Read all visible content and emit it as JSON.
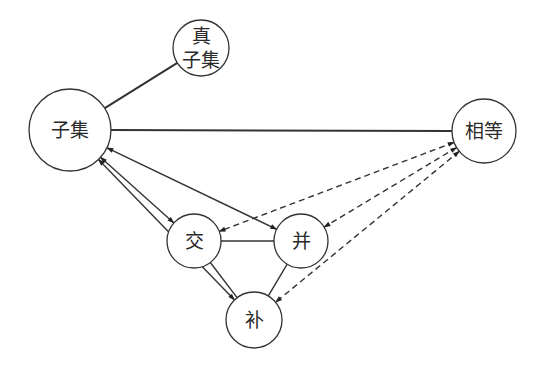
{
  "diagram": {
    "title": "",
    "nodes": [
      {
        "id": "proper_subset",
        "lines": [
          "真",
          "子集"
        ],
        "cx": 201,
        "cy": 48,
        "r": 28
      },
      {
        "id": "subset",
        "lines": [
          "子集"
        ],
        "cx": 70,
        "cy": 130,
        "r": 41
      },
      {
        "id": "equal",
        "lines": [
          "相等"
        ],
        "cx": 484,
        "cy": 131,
        "r": 32
      },
      {
        "id": "intersection",
        "lines": [
          "交"
        ],
        "cx": 194,
        "cy": 241,
        "r": 27
      },
      {
        "id": "union",
        "lines": [
          "并"
        ],
        "cx": 301,
        "cy": 241,
        "r": 27
      },
      {
        "id": "complement",
        "lines": [
          "补"
        ],
        "cx": 254,
        "cy": 320,
        "r": 28
      }
    ],
    "edges": [
      {
        "from": "subset",
        "to": "proper_subset",
        "style": "solid-thick",
        "arrow": "none"
      },
      {
        "from": "subset",
        "to": "equal",
        "style": "solid-thick",
        "arrow": "none"
      },
      {
        "from": "intersection",
        "to": "union",
        "style": "solid",
        "arrow": "none"
      },
      {
        "from": "intersection",
        "to": "complement",
        "style": "solid",
        "arrow": "none"
      },
      {
        "from": "union",
        "to": "complement",
        "style": "solid",
        "arrow": "none"
      },
      {
        "from": "subset",
        "to": "intersection",
        "style": "solid",
        "arrow": "both"
      },
      {
        "from": "subset",
        "to": "union",
        "style": "solid",
        "arrow": "both"
      },
      {
        "from": "subset",
        "to": "complement",
        "style": "solid",
        "arrow": "both"
      },
      {
        "from": "equal",
        "to": "intersection",
        "style": "dashed",
        "arrow": "both"
      },
      {
        "from": "equal",
        "to": "union",
        "style": "dashed",
        "arrow": "both"
      },
      {
        "from": "equal",
        "to": "complement",
        "style": "dashed",
        "arrow": "both"
      }
    ]
  }
}
